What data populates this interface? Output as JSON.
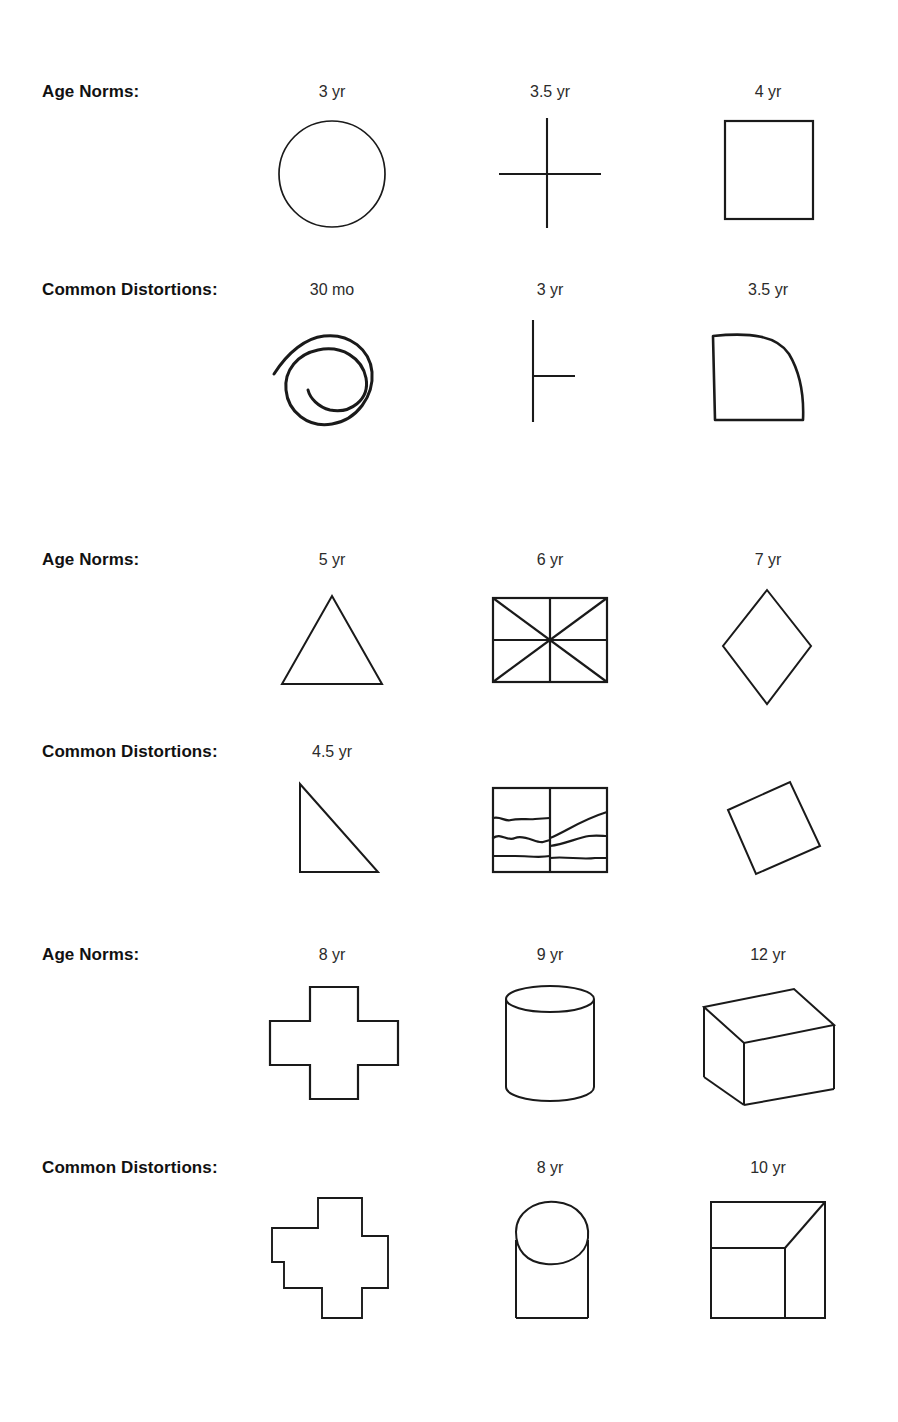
{
  "figure": {
    "background_color": "#ffffff",
    "ink_color": "#1a1a1a",
    "row_label_norms": "Age Norms:",
    "row_label_distortions": "Common Distortions:",
    "blocks": [
      {
        "norms": {
          "label": "Age Norms:",
          "cells": [
            {
              "age": "3 yr",
              "shape": "circle"
            },
            {
              "age": "3.5 yr",
              "shape": "cross"
            },
            {
              "age": "4 yr",
              "shape": "square"
            }
          ]
        },
        "distortions": {
          "label": "Common Distortions:",
          "cells": [
            {
              "age": "30 mo",
              "shape": "scribbled-spiral-circle"
            },
            {
              "age": "3 yr",
              "shape": "t-shape-cross"
            },
            {
              "age": "3.5 yr",
              "shape": "rounded-corner-square"
            }
          ]
        }
      },
      {
        "norms": {
          "label": "Age Norms:",
          "cells": [
            {
              "age": "5 yr",
              "shape": "triangle"
            },
            {
              "age": "6 yr",
              "shape": "divided-rectangle"
            },
            {
              "age": "7 yr",
              "shape": "diamond"
            }
          ]
        },
        "distortions": {
          "label": "Common Distortions:",
          "cells": [
            {
              "age": "4.5 yr",
              "shape": "right-triangle"
            },
            {
              "age": "",
              "shape": "wavy-divided-rectangle"
            },
            {
              "age": "",
              "shape": "tilted-square"
            }
          ]
        }
      },
      {
        "norms": {
          "label": "Age Norms:",
          "cells": [
            {
              "age": "8 yr",
              "shape": "greek-cross"
            },
            {
              "age": "9 yr",
              "shape": "cylinder"
            },
            {
              "age": "12 yr",
              "shape": "cube"
            }
          ]
        },
        "distortions": {
          "label": "Common Distortions:",
          "cells": [
            {
              "age": "",
              "shape": "stepped-irregular-cross"
            },
            {
              "age": "8 yr",
              "shape": "oval-on-rectangle"
            },
            {
              "age": "10 yr",
              "shape": "flat-cube-with-diagonal"
            }
          ]
        }
      }
    ]
  }
}
